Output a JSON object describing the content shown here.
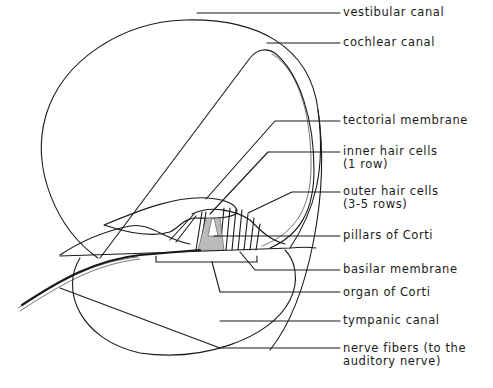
{
  "diagram": {
    "labels": [
      {
        "id": "vestibular-canal",
        "text": "vestibular canal",
        "line2": ""
      },
      {
        "id": "cochlear-canal",
        "text": "cochlear canal",
        "line2": ""
      },
      {
        "id": "tectorial-membrane",
        "text": "tectorial membrane",
        "line2": ""
      },
      {
        "id": "inner-hair-cells",
        "text": "inner hair cells",
        "line2": "(1 row)"
      },
      {
        "id": "outer-hair-cells",
        "text": "outer hair cells",
        "line2": "(3-5 rows)"
      },
      {
        "id": "pillars-of-corti",
        "text": "pillars of Corti",
        "line2": ""
      },
      {
        "id": "basilar-membrane",
        "text": "basilar membrane",
        "line2": ""
      },
      {
        "id": "organ-of-corti",
        "text": "organ of Corti",
        "line2": ""
      },
      {
        "id": "tympanic-canal",
        "text": "tympanic canal",
        "line2": ""
      },
      {
        "id": "nerve-fibers",
        "text": "nerve fibers (to the",
        "line2": "auditory nerve)"
      }
    ],
    "colors": {
      "stroke": "#1a1a1a",
      "background": "#ffffff",
      "shading": "#bbbbbb"
    }
  }
}
